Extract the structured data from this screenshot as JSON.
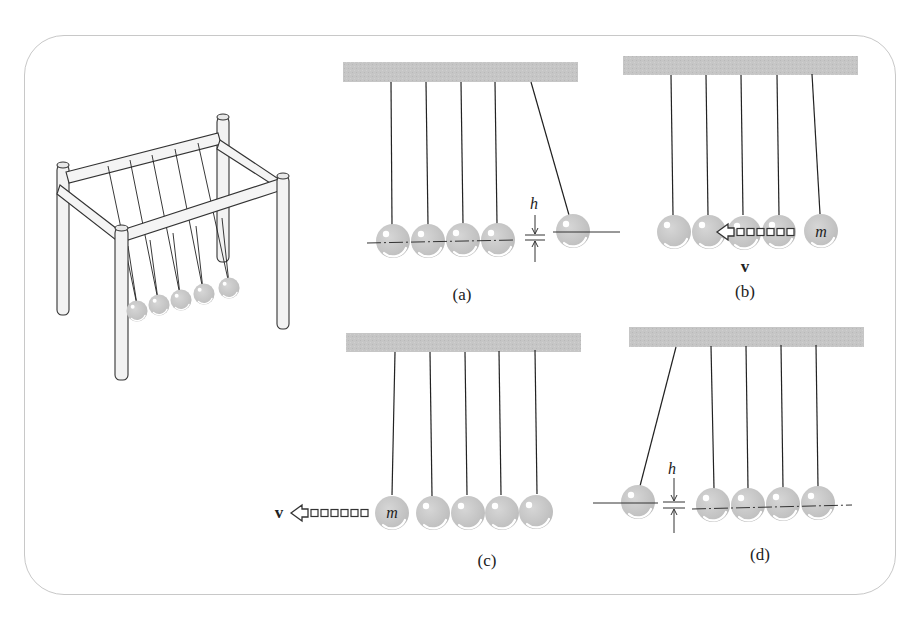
{
  "figure": {
    "panels": [
      {
        "id": "a",
        "label": "(a)",
        "height_symbol": "h",
        "description": "Rightmost ball pulled back and raised by height h"
      },
      {
        "id": "b",
        "label": "(b)",
        "mass_symbol": "m",
        "velocity_symbol": "v",
        "description": "Ball of mass m released, moving with velocity v toward others"
      },
      {
        "id": "c",
        "label": "(c)",
        "mass_symbol": "m",
        "velocity_symbol": "v",
        "description": "Leftmost ball of mass m ejected with velocity v"
      },
      {
        "id": "d",
        "label": "(d)",
        "height_symbol": "h",
        "description": "Leftmost ball rises to height h"
      }
    ],
    "illustration": "Newton's cradle apparatus (perspective view) with five suspended balls",
    "colors": {
      "bar": "#c4c4c4",
      "ball": "#c8c8c8",
      "ball_highlight": "#ffffff",
      "string": "#333333",
      "border": "#c8c8c8",
      "text": "#222222"
    }
  }
}
